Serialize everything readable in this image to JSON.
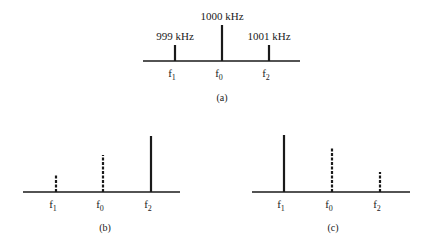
{
  "panels": [
    {
      "id": "a",
      "caption": "(a)",
      "axis": {
        "x1": 143,
        "x2": 300,
        "y": 61
      },
      "caption_pos": {
        "x": 222,
        "y": 101
      },
      "lines": [
        {
          "name": "f1",
          "label": "f",
          "sub": "1",
          "freq_label": "999 kHz",
          "x": 175,
          "top": 45,
          "style": "solid"
        },
        {
          "name": "f0",
          "label": "f",
          "sub": "0",
          "freq_label": "1000 kHz",
          "x": 222,
          "top": 25,
          "style": "solid"
        },
        {
          "name": "f2",
          "label": "f",
          "sub": "2",
          "freq_label": "1001 kHz",
          "x": 269,
          "top": 45,
          "style": "solid"
        }
      ]
    },
    {
      "id": "b",
      "caption": "(b)",
      "axis": {
        "x1": 23,
        "x2": 180,
        "y": 192
      },
      "caption_pos": {
        "x": 105,
        "y": 231
      },
      "lines": [
        {
          "name": "f1",
          "label": "f",
          "sub": "1",
          "x": 56,
          "top": 174,
          "style": "dashed"
        },
        {
          "name": "f0",
          "label": "f",
          "sub": "0",
          "x": 103,
          "top": 155,
          "style": "dashed"
        },
        {
          "name": "f2",
          "label": "f",
          "sub": "2",
          "x": 151,
          "top": 136,
          "style": "solid"
        }
      ]
    },
    {
      "id": "c",
      "caption": "(c)",
      "axis": {
        "x1": 252,
        "x2": 410,
        "y": 192
      },
      "caption_pos": {
        "x": 333,
        "y": 231
      },
      "lines": [
        {
          "name": "f1",
          "label": "f",
          "sub": "1",
          "x": 284,
          "top": 135,
          "style": "solid"
        },
        {
          "name": "f0",
          "label": "f",
          "sub": "0",
          "x": 332,
          "top": 148,
          "style": "dashed"
        },
        {
          "name": "f2",
          "label": "f",
          "sub": "2",
          "x": 380,
          "top": 172,
          "style": "dashed"
        }
      ]
    }
  ],
  "colors": {
    "ink": "#1a1a1a",
    "background": "#ffffff"
  }
}
